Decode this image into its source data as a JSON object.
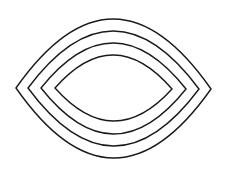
{
  "diagram": {
    "stroke_color": "#1a1a1a",
    "background": "#ffffff",
    "lenses": [
      {
        "id": "outer",
        "left": [
          16,
          88
        ],
        "right": [
          211,
          89
        ],
        "top_y": 19,
        "bottom_y": 158
      },
      {
        "id": "second",
        "left": [
          28,
          88
        ],
        "right": [
          199,
          89
        ],
        "top_y": 31,
        "bottom_y": 146
      },
      {
        "id": "third",
        "left": [
          41,
          88
        ],
        "right": [
          186,
          89
        ],
        "top_y": 43,
        "bottom_y": 134
      },
      {
        "id": "inner",
        "left": [
          55,
          88
        ],
        "right": [
          172,
          89
        ],
        "top_y": 55,
        "bottom_y": 121
      }
    ]
  }
}
